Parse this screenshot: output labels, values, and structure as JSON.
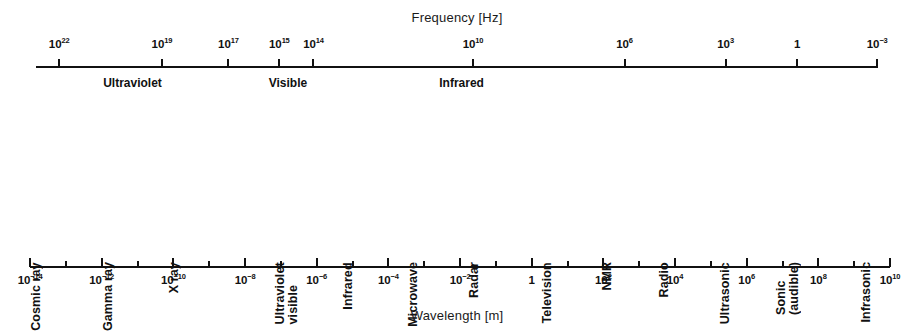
{
  "figure": {
    "title_top": "Frequency [Hz]",
    "title_bottom": "Wavelength [m]"
  },
  "chart_data": {
    "type": "diagram",
    "axes": [
      {
        "name": "frequency",
        "label": "Frequency [Hz]",
        "unit": "Hz",
        "position": "top",
        "direction": "decreasing-left-to-right",
        "tick_labels": [
          "10²²",
          "10¹⁹",
          "10¹⁷",
          "10¹⁵",
          "10¹⁴",
          "10¹⁰",
          "10⁶",
          "10³",
          "1",
          "10⁻³"
        ],
        "tick_exponents": [
          22,
          19,
          17,
          15,
          14,
          10,
          6,
          3,
          0,
          -3
        ]
      },
      {
        "name": "wavelength",
        "label": "Wavelength [m]",
        "unit": "m",
        "position": "bottom",
        "direction": "increasing-left-to-right",
        "tick_labels": [
          "10⁻¹⁴",
          "10⁻¹²",
          "10⁻¹⁰",
          "10⁻⁸",
          "10⁻⁶",
          "10⁻⁴",
          "10⁻²",
          "1",
          "10²",
          "10⁴",
          "10⁶",
          "10⁸",
          "10¹⁰"
        ],
        "tick_exponents": [
          -14,
          -12,
          -10,
          -8,
          -6,
          -4,
          -2,
          0,
          2,
          4,
          6,
          8,
          10
        ]
      }
    ],
    "frequency_bands": [
      {
        "label": "Ultraviolet",
        "x_pct": 14.5
      },
      {
        "label": "Visible",
        "x_pct": 31.5
      },
      {
        "label": "Infrared",
        "x_pct": 50.5
      }
    ],
    "spectrum_regions": [
      {
        "label_line1": "Cosmic ray",
        "label_line2": "",
        "x_pct": 4.7
      },
      {
        "label_line1": "Gamma ray",
        "label_line2": "",
        "x_pct": 12.6
      },
      {
        "label_line1": "X ray",
        "label_line2": "",
        "x_pct": 19.8
      },
      {
        "label_line1": "Ultraviolet",
        "label_line2": "visible",
        "x_pct": 32.8
      },
      {
        "label_line1": "Infrared",
        "label_line2": "",
        "x_pct": 38.8
      },
      {
        "label_line1": "Microwave",
        "label_line2": "",
        "x_pct": 46.0
      },
      {
        "label_line1": "Radar",
        "label_line2": "",
        "x_pct": 52.6
      },
      {
        "label_line1": "Television",
        "label_line2": "",
        "x_pct": 60.6
      },
      {
        "label_line1": "NMR",
        "label_line2": "",
        "x_pct": 67.2
      },
      {
        "label_line1": "Radio",
        "label_line2": "",
        "x_pct": 73.4
      },
      {
        "label_line1": "Ultrasonic",
        "label_line2": "",
        "x_pct": 80.1
      },
      {
        "label_line1": "Sonic",
        "label_line2": "(audible)",
        "x_pct": 87.6
      },
      {
        "label_line1": "Infrasonic",
        "label_line2": "",
        "x_pct": 95.5
      }
    ],
    "colors": {
      "ink": "#111111",
      "background": "#ffffff"
    }
  }
}
